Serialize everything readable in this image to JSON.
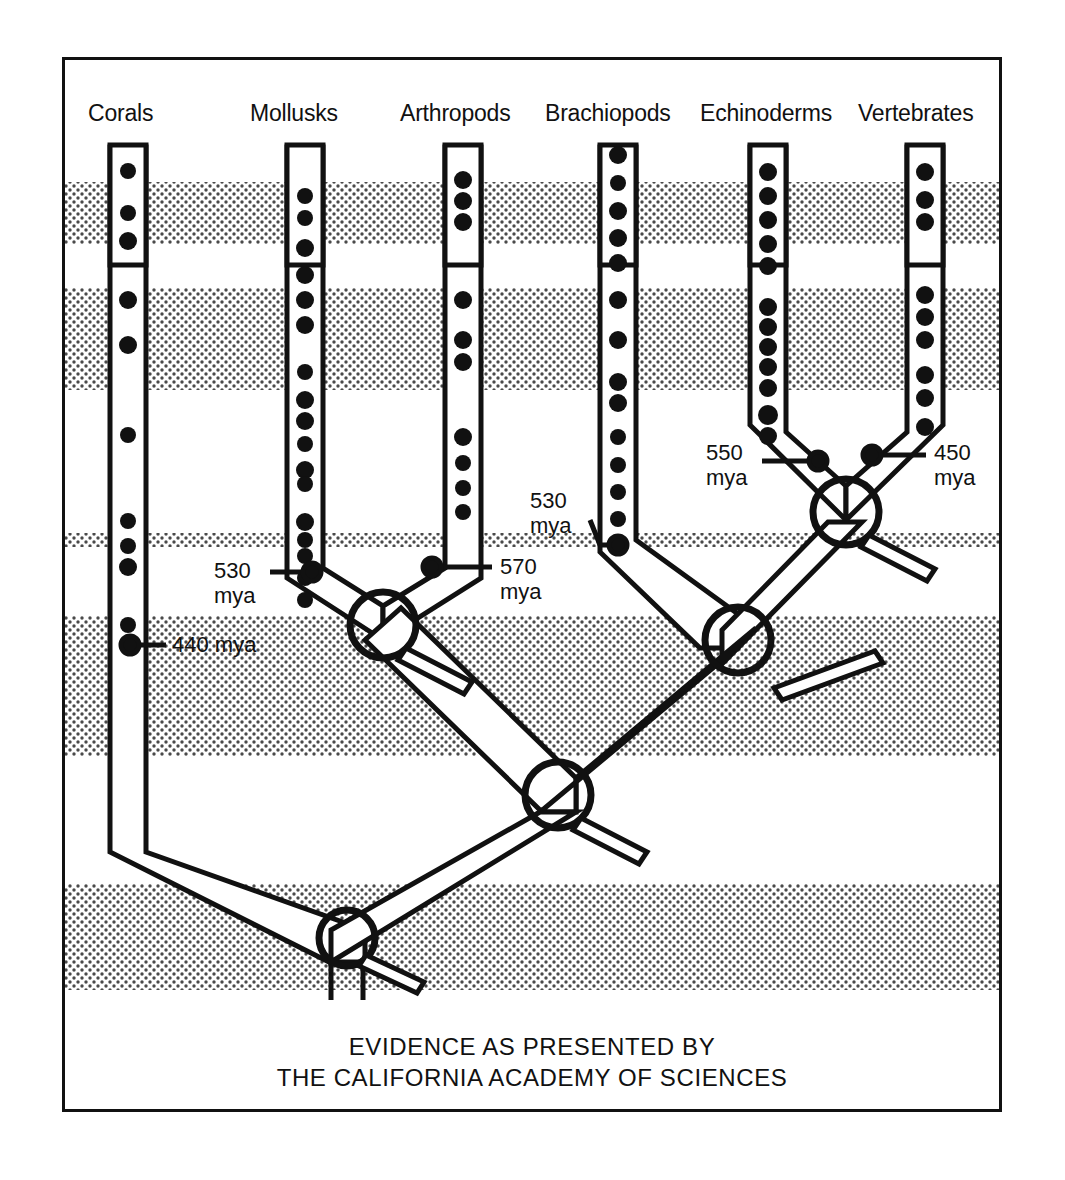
{
  "figure": {
    "caption_line1": "EVIDENCE AS PRESENTED BY",
    "caption_line2": "THE CALIFORNIA ACADEMY OF SCIENCES",
    "ink_color": "#111111",
    "band_color": "#555555",
    "background_color": "#ffffff"
  },
  "columns": [
    {
      "label": "Corals",
      "x": 128,
      "top": 145,
      "bottom": 850,
      "width": 36,
      "dots": [
        171,
        213,
        241,
        300,
        345,
        435,
        521,
        546,
        567,
        625,
        645
      ]
    },
    {
      "label": "Mollusks",
      "x": 305,
      "top": 145,
      "bottom": 575,
      "width": 36,
      "dots": [
        196,
        218,
        248,
        275,
        300,
        325,
        372,
        400,
        421,
        444,
        470,
        484,
        522,
        540,
        556,
        578,
        600
      ]
    },
    {
      "label": "Arthropods",
      "x": 463,
      "top": 145,
      "bottom": 575,
      "width": 36,
      "dots": [
        180,
        201,
        222,
        300,
        340,
        362,
        437,
        463,
        488,
        512
      ]
    },
    {
      "label": "Brachiopods",
      "x": 618,
      "top": 145,
      "bottom": 548,
      "width": 36,
      "dots": [
        155,
        183,
        211,
        238,
        263,
        300,
        340,
        382,
        403,
        437,
        465,
        492,
        519,
        545
      ]
    },
    {
      "label": "Echinoderms",
      "x": 768,
      "top": 145,
      "bottom": 450,
      "width": 36,
      "dots": [
        172,
        196,
        220,
        244,
        266,
        307,
        327,
        347,
        367,
        388,
        415,
        436
      ]
    },
    {
      "label": "Vertebrates",
      "x": 925,
      "top": 145,
      "bottom": 450,
      "width": 36,
      "dots": [
        172,
        200,
        222,
        295,
        317,
        340,
        375,
        398,
        427
      ]
    }
  ],
  "bands": [
    {
      "top": 182,
      "height": 62
    },
    {
      "top": 288,
      "height": 102
    },
    {
      "top": 533,
      "height": 14
    },
    {
      "top": 616,
      "height": 140
    },
    {
      "top": 884,
      "height": 106
    }
  ],
  "annotations": [
    {
      "id": "corals-440",
      "text_line1": "440 mya",
      "text_line2": "",
      "x": 168,
      "y": 633,
      "align": "left"
    },
    {
      "id": "mollusks-530",
      "text_line1": "530",
      "text_line2": "mya",
      "x": 214,
      "y": 561,
      "align": "left"
    },
    {
      "id": "arthropods-570",
      "text_line1": "570",
      "text_line2": "mya",
      "x": 496,
      "y": 561,
      "align": "left"
    },
    {
      "id": "brachiopods-530",
      "text_line1": "530",
      "text_line2": "mya",
      "x": 530,
      "y": 495,
      "align": "left"
    },
    {
      "id": "echinoderms-550",
      "text_line1": "550",
      "text_line2": "mya",
      "x": 705,
      "y": 444,
      "align": "left"
    },
    {
      "id": "vertebrates-450",
      "text_line1": "450",
      "text_line2": "mya",
      "x": 928,
      "y": 444,
      "align": "left"
    }
  ],
  "nodes": [
    {
      "id": "node-mollusks-arthropods",
      "cx": 383,
      "cy": 625,
      "r": 33
    },
    {
      "id": "node-deuterostomes",
      "cx": 738,
      "cy": 640,
      "r": 33
    },
    {
      "id": "node-echinoderms-vertebrates",
      "cx": 846,
      "cy": 512,
      "r": 33
    },
    {
      "id": "node-bilateria",
      "cx": 558,
      "cy": 795,
      "r": 33
    },
    {
      "id": "node-root",
      "cx": 347,
      "cy": 938,
      "r": 28
    }
  ]
}
